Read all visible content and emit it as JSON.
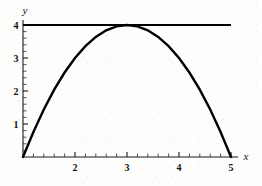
{
  "chart_data": {
    "type": "line",
    "title": "",
    "subtitle": "",
    "xlabel": "x",
    "ylabel": "y",
    "xlim": [
      1,
      5
    ],
    "ylim": [
      0,
      4
    ],
    "grid": false,
    "legend": "none",
    "x_ticks": [
      2,
      3,
      4,
      5
    ],
    "x_tick_labels": [
      "2",
      "3",
      "4",
      "5"
    ],
    "y_ticks": [
      1,
      2,
      3,
      4
    ],
    "y_tick_labels": [
      "1",
      "2",
      "3",
      "4"
    ],
    "x_minor_tick_step": 0.2,
    "y_minor_tick_step": 0.2,
    "series": [
      {
        "name": "parabola",
        "equation": "y = -(x-3)^2 + 4",
        "style": "solid",
        "color": "#000000",
        "x": [
          1,
          1.2,
          1.4,
          1.6,
          1.8,
          2,
          2.2,
          2.4,
          2.6,
          2.8,
          3,
          3.2,
          3.4,
          3.6,
          3.8,
          4,
          4.2,
          4.4,
          4.6,
          4.8,
          5
        ],
        "values": [
          0,
          0.76,
          1.44,
          2.04,
          2.56,
          3,
          3.36,
          3.64,
          3.84,
          3.96,
          4,
          3.96,
          3.84,
          3.64,
          3.36,
          3,
          2.56,
          2.04,
          1.44,
          0.76,
          0
        ]
      },
      {
        "name": "horizontal-line",
        "equation": "y = 4",
        "style": "solid",
        "color": "#000000",
        "x": [
          1,
          5
        ],
        "values": [
          4,
          4
        ]
      }
    ],
    "annotations": [
      {
        "label": "vertex",
        "x": 3,
        "y": 4
      },
      {
        "label": "root-left",
        "x": 1,
        "y": 0
      },
      {
        "label": "root-right",
        "x": 5,
        "y": 0
      }
    ]
  },
  "axes": {
    "x_axis_label": "x",
    "y_axis_label": "y"
  }
}
